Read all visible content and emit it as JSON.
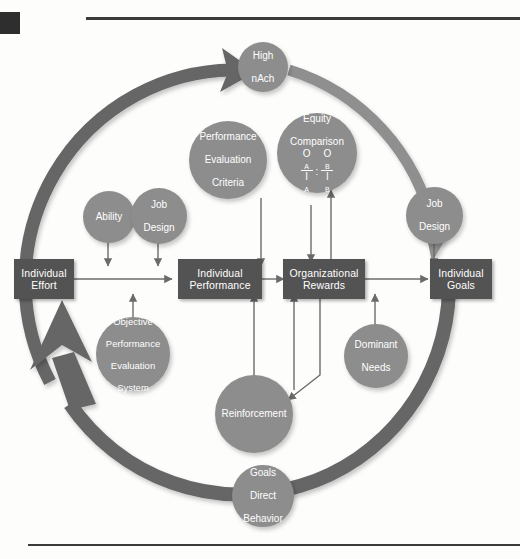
{
  "figure": {
    "palette": {
      "box_fill": "#535353",
      "circle_fill": "#8d8d8d",
      "arc_fill": "#666666",
      "arrow": "#6b6b6b",
      "text_on_dark": "#ffffff",
      "rule": "#3b3b3b",
      "background": "#fdfdfc"
    }
  },
  "boxes": [
    {
      "id": "individual-effort",
      "label_line1": "Individual",
      "label_line2": "Effort"
    },
    {
      "id": "individual-performance",
      "label_line1": "Individual",
      "label_line2": "Performance"
    },
    {
      "id": "organizational-rewards",
      "label_line1": "Organizational",
      "label_line2": "Rewards"
    },
    {
      "id": "individual-goals",
      "label_line1": "Individual",
      "label_line2": "Goals"
    }
  ],
  "circles": [
    {
      "id": "high-nach",
      "line1": "High",
      "line2": "nAch",
      "line3": "",
      "line4": ""
    },
    {
      "id": "ability",
      "line1": "Ability",
      "line2": "",
      "line3": "",
      "line4": ""
    },
    {
      "id": "job-design-left",
      "line1": "Job",
      "line2": "Design",
      "line3": "",
      "line4": ""
    },
    {
      "id": "perf-eval-criteria",
      "line1": "Performance",
      "line2": "Evaluation",
      "line3": "Criteria",
      "line4": ""
    },
    {
      "id": "equity-comparison",
      "line1": "Equity",
      "line2": "Comparison",
      "line3": "",
      "line4": ""
    },
    {
      "id": "job-design-right",
      "line1": "Job",
      "line2": "Design",
      "line3": "",
      "line4": ""
    },
    {
      "id": "objective-perf-eval-system",
      "line1": "Objective",
      "line2": "Performance",
      "line3": "Evaluation",
      "line4": "System"
    },
    {
      "id": "dominant-needs",
      "line1": "Dominant",
      "line2": "Needs",
      "line3": "",
      "line4": ""
    },
    {
      "id": "reinforcement",
      "line1": "Reinforcement",
      "line2": "",
      "line3": "",
      "line4": ""
    },
    {
      "id": "goals-direct-behavior",
      "line1": "Goals",
      "line2": "Direct",
      "line3": "Behavior",
      "line4": ""
    }
  ],
  "equity_formula": {
    "left_numerator": "O",
    "left_numerator_sub": "A",
    "left_denominator": "I",
    "left_denominator_sub": "A",
    "separator": ":",
    "right_numerator": "O",
    "right_numerator_sub": "B",
    "right_denominator": "I",
    "right_denominator_sub": "B"
  },
  "flow": {
    "effort_to_performance": "Individual Effort → Individual Performance",
    "performance_to_rewards": "Individual Performance → Organizational Rewards",
    "rewards_to_goals": "Organizational Rewards → Individual Goals",
    "goals_loop_back": "Individual Goals → High nAch → Individual Effort"
  }
}
